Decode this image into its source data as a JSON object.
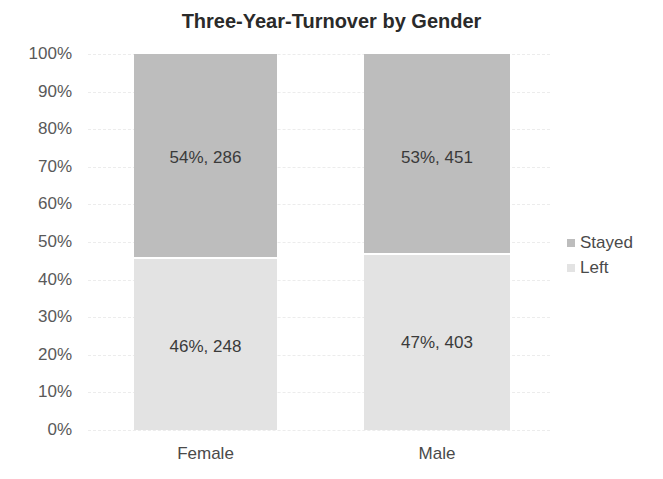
{
  "chart_data": {
    "type": "bar",
    "stacked": true,
    "normalized": true,
    "title": "Three-Year-Turnover by Gender",
    "xlabel": "",
    "ylabel": "",
    "ylim": [
      0,
      100
    ],
    "yticks": [
      "0%",
      "10%",
      "20%",
      "30%",
      "40%",
      "50%",
      "60%",
      "70%",
      "80%",
      "90%",
      "100%"
    ],
    "categories": [
      "Female",
      "Male"
    ],
    "series": [
      {
        "name": "Left",
        "values_pct": [
          46,
          47
        ],
        "counts": [
          248,
          403
        ],
        "labels": [
          "46%, 248",
          "47%, 403"
        ],
        "color": "#e3e3e3"
      },
      {
        "name": "Stayed",
        "values_pct": [
          54,
          53
        ],
        "counts": [
          286,
          451
        ],
        "labels": [
          "54%, 286",
          "53%, 451"
        ],
        "color": "#bdbdbd"
      }
    ],
    "legend": {
      "position": "right",
      "entries": [
        "Stayed",
        "Left"
      ]
    },
    "grid": true
  },
  "legend": {
    "stayed": "Stayed",
    "left": "Left"
  }
}
